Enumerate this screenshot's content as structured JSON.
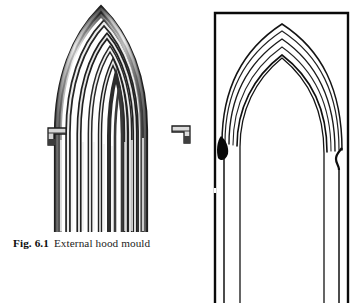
{
  "figure": {
    "caption_number": "Fig. 6.1",
    "caption_title": "External hood mould"
  },
  "colors": {
    "page_background": "#ffffff",
    "ink": "#111111",
    "photo_dark": "#1a1a1a",
    "photo_mid": "#6e6e6e",
    "photo_light": "#d8d8d8",
    "frame": "#0a0a0a"
  },
  "photo_plate": {
    "name": "photograph of external hood mould",
    "description": "half-tone photograph of a two-centred pointed arch with seven concentric roll mouldings and returned corbel label stops",
    "rib_count": 7,
    "apex": {
      "x": 101,
      "y": 9
    },
    "springing_left": {
      "x": 60,
      "y": 132
    },
    "springing_right": {
      "x": 176,
      "y": 130
    },
    "label_stop_left": {
      "x": 48,
      "y": 128,
      "w": 18,
      "h": 17
    },
    "label_stop_right": {
      "x": 172,
      "y": 126,
      "w": 18,
      "h": 17
    },
    "jamb_fade_bottom": 232
  },
  "drawing_panel": {
    "name": "measured line drawing of the same arch",
    "description": "framed outline elevation of the pointed arch showing the hood mould profile and jamb lines",
    "frame": {
      "x": 2,
      "y": 2,
      "w": 135,
      "h": 291,
      "stroke_width": 2.2
    },
    "frame_open_bottom": true,
    "apex": {
      "x": 70,
      "y": 18
    },
    "band_count": 4,
    "springing_left": {
      "x": 12,
      "y": 130
    },
    "springing_right": {
      "x": 128,
      "y": 138
    },
    "stop_blob_left": {
      "x": 12,
      "y": 135
    },
    "stop_kink_right": {
      "x": 127,
      "y": 143
    },
    "jamb_bottom": 293
  }
}
